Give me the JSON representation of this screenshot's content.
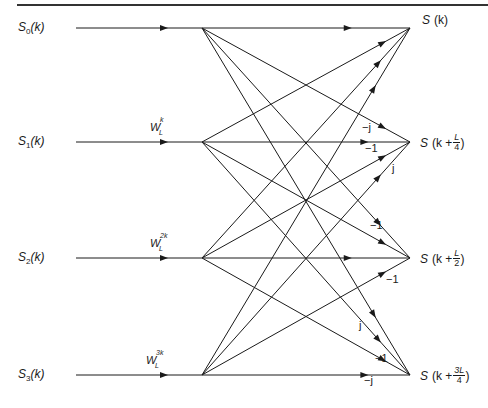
{
  "diagram": {
    "inputs": [
      {
        "name": "S",
        "sub": "0",
        "arg": "(k)",
        "y": 28
      },
      {
        "name": "S",
        "sub": "1",
        "arg": "(k)",
        "y": 142
      },
      {
        "name": "S",
        "sub": "2",
        "arg": "(k)",
        "y": 258
      },
      {
        "name": "S",
        "sub": "3",
        "arg": "(k)",
        "y": 375
      }
    ],
    "twiddles": [
      {
        "base": "W",
        "sub": "L",
        "sup": "",
        "row": 0
      },
      {
        "base": "W",
        "sub": "L",
        "sup": "k",
        "row": 1
      },
      {
        "base": "W",
        "sub": "L",
        "sup": "2k",
        "row": 2
      },
      {
        "base": "W",
        "sub": "L",
        "sup": "3k",
        "row": 3
      }
    ],
    "outputs": [
      {
        "prefix": "S",
        "text": "(k)",
        "frac_num": "",
        "frac_den": "",
        "y": 28
      },
      {
        "prefix": "S",
        "text": "(k +",
        "frac_num": "L",
        "frac_den": "4",
        "close": ")",
        "y": 142
      },
      {
        "prefix": "S",
        "text": "(k +",
        "frac_num": "L",
        "frac_den": "2",
        "close": ")",
        "y": 258
      },
      {
        "prefix": "S",
        "text": "(k +",
        "frac_num": "3L",
        "frac_den": "4",
        "close": ")",
        "y": 375
      }
    ],
    "coefficients": [
      {
        "label": "−j",
        "x": 362,
        "y": 127,
        "row_out": 1,
        "row_in": 0
      },
      {
        "label": "−1",
        "x": 365,
        "y": 148,
        "row_out": 1,
        "row_in": 2
      },
      {
        "label": "j",
        "x": 392,
        "y": 168,
        "row_out": 1,
        "row_in": 3
      },
      {
        "label": "−1",
        "x": 370,
        "y": 225,
        "row_out": 2,
        "row_in": 1
      },
      {
        "label": "−1",
        "x": 386,
        "y": 279,
        "row_out": 2,
        "row_in": 3
      },
      {
        "label": "j",
        "x": 359,
        "y": 325,
        "row_out": 3,
        "row_in": 1
      },
      {
        "label": "−1",
        "x": 375,
        "y": 358,
        "row_out": 3,
        "row_in": 2
      },
      {
        "label": "−j",
        "x": 364,
        "y": 380,
        "row_out": 3,
        "row_in": 3
      }
    ],
    "geometry": {
      "input_line_start_x": 76,
      "input_node_x": 202,
      "output_node_x": 410,
      "rows_y": [
        28,
        142,
        258,
        375
      ],
      "top_rule_y": 5,
      "stroke": "#1a1a1a"
    }
  }
}
